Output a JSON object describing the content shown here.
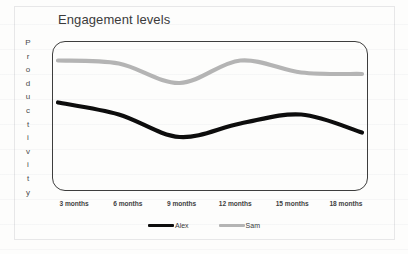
{
  "chart_data": {
    "type": "line",
    "title": "Engagement levels",
    "xlabel": "",
    "ylabel": "Productivity",
    "grid": false,
    "legend_position": "bottom-center",
    "categories": [
      "3 months",
      "6 months",
      "9 months",
      "12 months",
      "15 months",
      "18 months"
    ],
    "x": [
      3,
      6,
      9,
      12,
      15,
      18
    ],
    "xlim": [
      3,
      18
    ],
    "ylim": [
      0,
      100
    ],
    "series": [
      {
        "name": "Alex",
        "color": "#0d0d0d",
        "values": [
          59,
          51,
          36,
          45,
          51,
          39
        ]
      },
      {
        "name": "Sam",
        "color": "#b4b4b4",
        "values": [
          87,
          85,
          72,
          87,
          79,
          78
        ]
      }
    ]
  },
  "chart": {
    "title": "Engagement levels",
    "y_axis_title": "Productivity",
    "y_axis_letters": [
      "P",
      "r",
      "o",
      "d",
      "u",
      "c",
      "t",
      "i",
      "v",
      "i",
      "t",
      "y"
    ],
    "x_tick_labels": [
      "3 months",
      "6 months",
      "9 months",
      "12 months",
      "15 months",
      "18 months"
    ],
    "legend": [
      {
        "label": "Alex",
        "color": "#0d0d0d"
      },
      {
        "label": "Sam",
        "color": "#b4b4b4"
      }
    ],
    "colors": {
      "alex_line": "#0d0d0d",
      "sam_line": "#b4b4b4",
      "plot_border": "#3d3d3d",
      "title_text": "#3b3b3b",
      "axis_text": "#3f3f3f",
      "background": "#fdfdfc"
    }
  }
}
